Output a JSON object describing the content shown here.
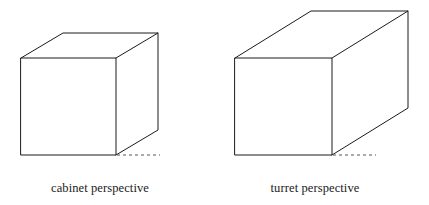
{
  "figure": {
    "background_color": "#ffffff",
    "stroke_color": "#1b1b1b",
    "stroke_width": 1.0,
    "dash_pattern": "3 3"
  },
  "diagram_data": {
    "type": "technical-drawing",
    "subject": "axonometric / oblique projection comparison of a box",
    "description": "Two line drawings of a rectangular box shown in two oblique projection styles, each labelled beneath.",
    "panels": [
      {
        "id": "cabinet",
        "label": "cabinet perspective",
        "front_face": {
          "x": 21,
          "y": 58,
          "width": 95,
          "height": 97
        },
        "depth_vector": {
          "dx": 42,
          "dy": -25
        },
        "receding_angle_deg": 30.8,
        "depth_length_px": 48.9,
        "ground_dash": {
          "x1": 116,
          "y1": 155,
          "x2": 160,
          "y2": 155
        },
        "vertices": {
          "front_top_left": [
            21,
            58
          ],
          "front_top_right": [
            116,
            58
          ],
          "front_bottom_left": [
            21,
            155
          ],
          "front_bottom_right": [
            116,
            155
          ],
          "back_top_left": [
            63,
            33
          ],
          "back_top_right": [
            158,
            33
          ],
          "back_bottom_right": [
            158,
            130
          ]
        }
      },
      {
        "id": "turret",
        "label": "turret perspective",
        "front_face": {
          "x": 235,
          "y": 58,
          "width": 97,
          "height": 97
        },
        "depth_vector": {
          "dx": 76,
          "dy": -47
        },
        "receding_angle_deg": 31.7,
        "depth_length_px": 89.4,
        "ground_dash": {
          "x1": 332,
          "y1": 155,
          "x2": 376,
          "y2": 155
        },
        "vertices": {
          "front_top_left": [
            235,
            58
          ],
          "front_top_right": [
            332,
            58
          ],
          "front_bottom_left": [
            235,
            155
          ],
          "front_bottom_right": [
            332,
            155
          ],
          "back_top_left": [
            311,
            11
          ],
          "back_top_right": [
            408,
            11
          ],
          "back_bottom_right": [
            408,
            108
          ]
        }
      }
    ]
  },
  "captions": {
    "left": "cabinet perspective",
    "right": "turret perspective"
  }
}
